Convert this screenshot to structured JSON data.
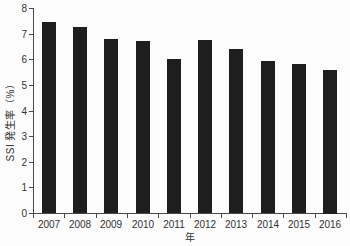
{
  "figure": {
    "xlabel": "年",
    "ylabel": "SSI 発生率（%）"
  },
  "chart_data": {
    "type": "bar",
    "title": "",
    "categories": [
      "2007",
      "2008",
      "2009",
      "2010",
      "2011",
      "2012",
      "2013",
      "2014",
      "2015",
      "2016"
    ],
    "values": [
      7.45,
      7.25,
      6.8,
      6.7,
      6.0,
      6.75,
      6.4,
      5.95,
      5.8,
      5.6
    ],
    "xlabel": "年",
    "ylabel": "SSI 発生率（%）",
    "ylim": [
      0,
      8
    ],
    "yticks": [
      0,
      1,
      2,
      3,
      4,
      5,
      6,
      7,
      8
    ],
    "x_tick_position": "between-categories",
    "grid": false,
    "legend": null,
    "bar_color": "#1e1e1e",
    "axis_color": "#4a4a4a",
    "text_color": "#333333",
    "background_color": "#fcfcfc"
  }
}
